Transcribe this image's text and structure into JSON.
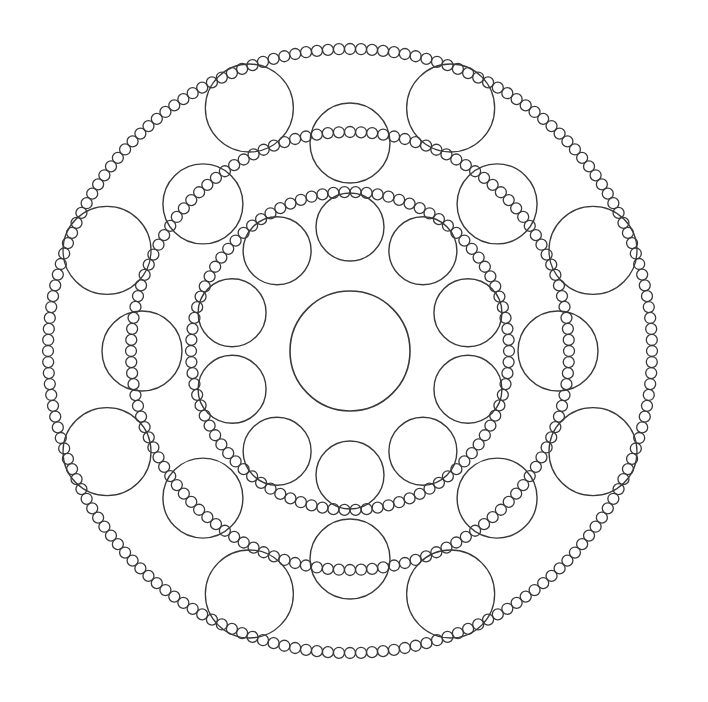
{
  "image": {
    "title": "Circular bead mandala line art",
    "width": 708,
    "height": 702,
    "background": "#ffffff",
    "stroke_color": "#3a3a3a"
  },
  "mandala": {
    "center": {
      "x": 350,
      "y": 351
    },
    "center_circle": {
      "r": 60,
      "stroke_width": 1.6
    },
    "bead_rings": [
      {
        "name": "inner-bead-ring",
        "radius": 159,
        "bead_r": 5.5,
        "count": 90,
        "stroke_width": 1.3
      },
      {
        "name": "middle-bead-ring",
        "radius": 219,
        "bead_r": 5.5,
        "count": 124,
        "stroke_width": 1.3
      },
      {
        "name": "outer-bead-ring",
        "radius": 302,
        "bead_r": 5.5,
        "count": 172,
        "stroke_width": 1.3
      }
    ],
    "circle_rings": [
      {
        "name": "inner-circle-ring",
        "distance": 124,
        "r": 34,
        "count": 10,
        "start_angle_deg": 0,
        "stroke_width": 1.4
      },
      {
        "name": "middle-circle-ring",
        "distance": 208,
        "r": 40,
        "count": 8,
        "start_angle_deg": 0,
        "stroke_width": 1.4
      },
      {
        "name": "outer-circle-ring",
        "distance": 263,
        "r": 44,
        "count": 8,
        "start_angle_deg": 22.5,
        "stroke_width": 1.3
      }
    ]
  }
}
